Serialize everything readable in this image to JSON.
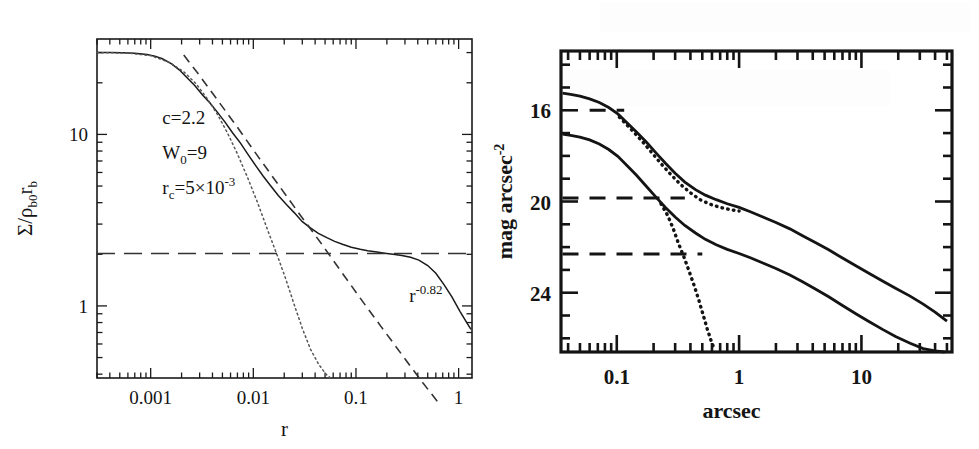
{
  "figure": {
    "caption": "",
    "background": "#ffffff",
    "ink": "#1a1a1a"
  },
  "chart_data": [
    {
      "id": "left-panel",
      "type": "line",
      "title": "",
      "xlabel": "r",
      "ylabel": "Σ/ρ_b0 r_b",
      "xscale": "log",
      "yscale": "log",
      "xlim": [
        0.0003,
        1.35
      ],
      "ylim": [
        0.38,
        36
      ],
      "grid": false,
      "legend": "none",
      "xticklabels": [
        "0.001",
        "0.01",
        "0.1",
        "1"
      ],
      "xtickvalues": [
        0.001,
        0.01,
        0.1,
        1
      ],
      "yticklabels": [
        "10",
        "1"
      ],
      "ytickvalues": [
        10,
        1
      ],
      "annotations": [
        {
          "name": "concentration",
          "text": "c=2.2",
          "x": 0.0013,
          "y": 11.5
        },
        {
          "name": "king-potential",
          "text": "W₀=9",
          "x": 0.0013,
          "y": 7.2
        },
        {
          "name": "core-radius",
          "text": "r_c=5×10⁻³",
          "x": 0.0013,
          "y": 4.5
        },
        {
          "name": "power-law-slope",
          "text": "r⁻⁰·⁸²",
          "x": 0.33,
          "y": 1.05
        }
      ],
      "series": [
        {
          "name": "observed-profile",
          "style": "solid",
          "description": "noisy King-plus-powerlaw surface density profile",
          "x": [
            0.0003,
            0.0004,
            0.00053,
            0.0007,
            0.00092,
            0.0011,
            0.0013,
            0.0016,
            0.0019,
            0.0023,
            0.0027,
            0.0032,
            0.0038,
            0.0045,
            0.0053,
            0.0063,
            0.0075,
            0.0088,
            0.0105,
            0.0125,
            0.0148,
            0.0175,
            0.021,
            0.025,
            0.03,
            0.036,
            0.043,
            0.052,
            0.062,
            0.075,
            0.09,
            0.11,
            0.13,
            0.16,
            0.19,
            0.23,
            0.28,
            0.34,
            0.41,
            0.5,
            0.6,
            0.72,
            0.86,
            1.03,
            1.2,
            1.32
          ],
          "y": [
            30.0,
            30.0,
            29.9,
            29.7,
            29.2,
            28.6,
            27.6,
            25.8,
            23.8,
            21.2,
            19.2,
            17.0,
            15.2,
            13.4,
            11.8,
            10.2,
            8.9,
            7.7,
            6.6,
            5.7,
            5.0,
            4.4,
            3.9,
            3.5,
            3.1,
            2.85,
            2.65,
            2.5,
            2.38,
            2.28,
            2.2,
            2.14,
            2.1,
            2.06,
            2.03,
            2.0,
            1.97,
            1.92,
            1.85,
            1.72,
            1.55,
            1.33,
            1.13,
            0.93,
            0.8,
            0.73
          ]
        },
        {
          "name": "king-model",
          "style": "dotted",
          "description": "pure King model, falls steeply beyond the core",
          "x": [
            0.0003,
            0.0006,
            0.001,
            0.0015,
            0.0021,
            0.0028,
            0.0036,
            0.0045,
            0.0056,
            0.007,
            0.0088,
            0.011,
            0.014,
            0.0175,
            0.021,
            0.025,
            0.03,
            0.036,
            0.043,
            0.051,
            0.058
          ],
          "y": [
            30.0,
            29.8,
            28.8,
            26.4,
            23.2,
            19.6,
            16.0,
            13.0,
            10.2,
            7.7,
            5.6,
            4.0,
            2.7,
            1.9,
            1.4,
            1.02,
            0.74,
            0.56,
            0.46,
            0.4,
            0.375
          ]
        },
        {
          "name": "power-law-fit",
          "style": "dashed",
          "description": "r^-0.82 power law asymptote",
          "x": [
            0.0021,
            0.003,
            0.0045,
            0.007,
            0.011,
            0.0175,
            0.028,
            0.045,
            0.07,
            0.11,
            0.175,
            0.28,
            0.45,
            0.65
          ],
          "y": [
            29.0,
            22.0,
            15.8,
            11.0,
            7.5,
            5.1,
            3.45,
            2.35,
            1.62,
            1.11,
            0.76,
            0.52,
            0.355,
            0.268
          ]
        },
        {
          "name": "constant-background",
          "style": "long-dashed",
          "description": "horizontal constant surface-density component",
          "x": [
            0.0003,
            1.32
          ],
          "y": [
            2.02,
            2.02
          ]
        }
      ]
    },
    {
      "id": "right-panel",
      "type": "line",
      "title": "",
      "xlabel": "arcsec",
      "ylabel": "mag arcsec⁻²",
      "xscale": "log",
      "yscale": "linear-inverted",
      "xlim": [
        0.035,
        55
      ],
      "ylim": [
        26.6,
        13.4
      ],
      "grid": false,
      "legend": "none",
      "xticklabels": [
        "0.1",
        "1",
        "10"
      ],
      "xtickvalues": [
        0.1,
        1,
        10
      ],
      "yticklabels": [
        "16",
        "20",
        "24"
      ],
      "ytickvalues": [
        16,
        20,
        24
      ],
      "annotations": [],
      "series": [
        {
          "name": "bright-profile-solid",
          "style": "solid",
          "description": "upper (brighter) observed surface brightness profile",
          "x": [
            0.036,
            0.042,
            0.05,
            0.06,
            0.072,
            0.086,
            0.102,
            0.12,
            0.145,
            0.175,
            0.21,
            0.25,
            0.3,
            0.36,
            0.44,
            0.53,
            0.65,
            0.8,
            1.0,
            1.25,
            1.6,
            2.0,
            2.6,
            3.3,
            4.2,
            5.4,
            7.0,
            9.0,
            11.5,
            15.0,
            19.0,
            25.0,
            32.0,
            40.0,
            50.0
          ],
          "y": [
            15.25,
            15.3,
            15.38,
            15.5,
            15.66,
            15.88,
            16.16,
            16.52,
            16.95,
            17.4,
            17.88,
            18.32,
            18.76,
            19.15,
            19.48,
            19.72,
            19.92,
            20.1,
            20.26,
            20.46,
            20.7,
            20.92,
            21.2,
            21.5,
            21.8,
            22.12,
            22.48,
            22.82,
            23.15,
            23.5,
            23.8,
            24.15,
            24.5,
            24.85,
            25.25
          ]
        },
        {
          "name": "faint-profile-solid",
          "style": "solid",
          "description": "lower (fainter) observed surface brightness profile",
          "x": [
            0.036,
            0.042,
            0.05,
            0.06,
            0.072,
            0.086,
            0.102,
            0.12,
            0.145,
            0.175,
            0.21,
            0.25,
            0.3,
            0.36,
            0.44,
            0.53,
            0.65,
            0.8,
            1.0,
            1.25,
            1.6,
            2.0,
            2.6,
            3.3,
            4.2,
            5.4,
            7.0,
            9.0,
            11.5,
            15.0,
            19.0,
            25.0,
            32.0,
            40.0,
            48.0
          ],
          "y": [
            17.05,
            17.1,
            17.18,
            17.3,
            17.48,
            17.72,
            18.02,
            18.4,
            18.85,
            19.34,
            19.82,
            20.26,
            20.68,
            21.05,
            21.38,
            21.66,
            21.9,
            22.1,
            22.28,
            22.48,
            22.72,
            22.94,
            23.22,
            23.52,
            23.84,
            24.18,
            24.56,
            24.92,
            25.26,
            25.62,
            25.92,
            26.22,
            26.45,
            26.55,
            26.6
          ]
        },
        {
          "name": "deconvolved-bright-dotted",
          "style": "dotted",
          "description": "dotted deconvolved / model profile for bright component",
          "x": [
            0.105,
            0.12,
            0.14,
            0.165,
            0.195,
            0.23,
            0.275,
            0.33,
            0.4,
            0.48,
            0.58,
            0.7,
            0.85,
            1.0
          ],
          "y": [
            16.3,
            16.62,
            17.0,
            17.42,
            17.88,
            18.34,
            18.8,
            19.24,
            19.62,
            19.92,
            20.12,
            20.26,
            20.36,
            20.42
          ]
        },
        {
          "name": "deconvolved-faint-dotted",
          "style": "dotted",
          "description": "dotted profile dropping steeply near 0.6 arcsec",
          "x": [
            0.23,
            0.26,
            0.29,
            0.32,
            0.355,
            0.39,
            0.43,
            0.47,
            0.51,
            0.55,
            0.59,
            0.63
          ],
          "y": [
            20.1,
            20.6,
            21.2,
            21.85,
            22.45,
            23.05,
            23.7,
            24.35,
            25.0,
            25.6,
            26.1,
            26.5
          ]
        },
        {
          "name": "background-level-bright",
          "style": "dashed",
          "description": "horizontal dashed constant-background level, upper",
          "x": [
            0.036,
            0.36
          ],
          "y": [
            19.85,
            19.85
          ]
        },
        {
          "name": "background-level-faint",
          "style": "dashed",
          "description": "horizontal dashed constant-background level, lower",
          "x": [
            0.036,
            0.5
          ],
          "y": [
            22.3,
            22.3
          ]
        },
        {
          "name": "king-cap-bright",
          "style": "dashed",
          "description": "short dashed segment marking the King core level at 16 mag",
          "x": [
            0.06,
            0.115
          ],
          "y": [
            16.0,
            16.0
          ]
        }
      ]
    }
  ]
}
